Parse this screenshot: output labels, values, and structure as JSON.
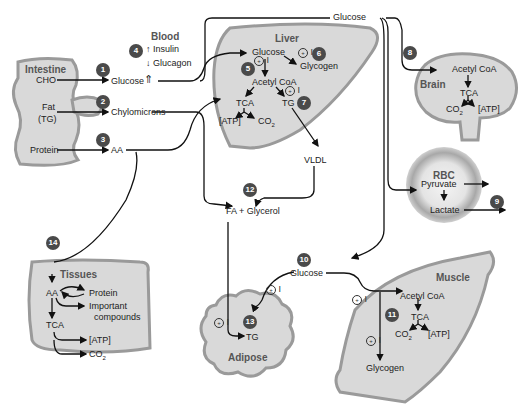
{
  "organs": {
    "intestine": "Intestine",
    "blood": "Blood",
    "liver": "Liver",
    "brain": "Brain",
    "rbc": "RBC",
    "tissues": "Tissues",
    "adipose": "Adipose",
    "muscle": "Muscle"
  },
  "intestine": {
    "cho": "CHO",
    "fat": "Fat",
    "tg": "(TG)",
    "protein": "Protein"
  },
  "absorbed": {
    "glucose": "Glucose",
    "chylomicrons": "Chylomicrons",
    "aa": "AA"
  },
  "blood": {
    "insulin": "Insulin",
    "glucagon": "Glucagon",
    "insulin_arrow": "↑",
    "glucagon_arrow": "↓",
    "glucose_arrow": "⇑"
  },
  "top_glucose": "Glucose",
  "liver": {
    "glucose": "Glucose",
    "glycogen": "Glycogen",
    "acetyl_coa": "Acetyl CoA",
    "tca": "TCA",
    "tg": "TG",
    "atp": "[ATP]",
    "co2": "CO",
    "co2_sub": "2"
  },
  "vldl": "VLDL",
  "fa_glycerol": "FA + Glycerol",
  "brain": {
    "acetyl_coa": "Acetyl CoA",
    "tca": "TCA",
    "co2": "CO",
    "co2_sub": "2",
    "atp": "[ATP]"
  },
  "rbc": {
    "pyruvate": "Pyruvate",
    "lactate": "Lactate"
  },
  "tissues": {
    "aa": "AA",
    "protein": "Protein",
    "important": "Important",
    "compounds": "compounds",
    "tca": "TCA",
    "atp": "[ATP]",
    "co2": "CO",
    "co2_sub": "2"
  },
  "glucose_10": "Glucose",
  "adipose": {
    "tg": "TG"
  },
  "muscle": {
    "acetyl_coa": "Acetyl CoA",
    "tca": "TCA",
    "co2": "CO",
    "co2_sub": "2",
    "atp": "[ATP]",
    "glycogen": "Glycogen"
  },
  "insulin_marker": {
    "symbol": "+",
    "label": "I"
  },
  "steps": [
    "1",
    "2",
    "3",
    "4",
    "5",
    "6",
    "7",
    "8",
    "9",
    "10",
    "11",
    "12",
    "13",
    "14"
  ],
  "colors": {
    "organ_fill": "#d9d9d9",
    "organ_edge": "#9a9a9a",
    "badge": "#4a4a4a",
    "line": "#111111"
  }
}
